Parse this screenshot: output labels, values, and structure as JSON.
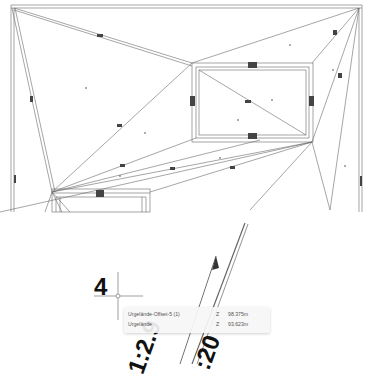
{
  "viewport": {
    "type": "cad-plan-view",
    "background": "#ffffff",
    "line_color": "#555555"
  },
  "labels": {
    "point_number": "4",
    "slope_left": "1:2.9",
    "slope_right": ":20"
  },
  "tooltip": {
    "rows": [
      {
        "name": "Urgelände-Offset-5 (1)",
        "axis": "Z",
        "value": "98.375m"
      },
      {
        "name": "Urgelände",
        "axis": "Z",
        "value": "93.623m"
      }
    ]
  },
  "cursor": {
    "type": "crosshair",
    "x": 118,
    "y": 296
  }
}
